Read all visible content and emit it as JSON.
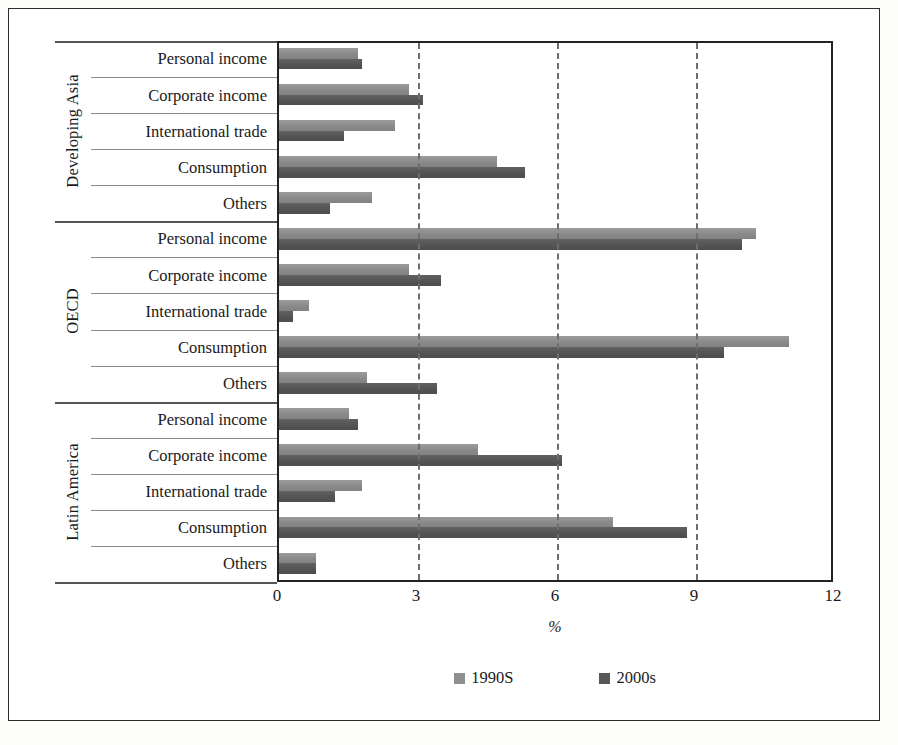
{
  "chart_data": {
    "type": "bar",
    "orientation": "horizontal",
    "title": "",
    "xlabel": "%",
    "ylabel": "",
    "xlim": [
      0,
      12
    ],
    "xticks": [
      "0",
      "3",
      "6",
      "9",
      "12"
    ],
    "grid": "vertical dashed at 3, 6, 9",
    "legend_position": "bottom",
    "series": [
      {
        "name": "1990S",
        "color": "#8f8f8f"
      },
      {
        "name": "2000s",
        "color": "#585858"
      }
    ],
    "groups": [
      {
        "name": "Developing Asia",
        "categories": [
          "Personal income",
          "Corporate income",
          "International trade",
          "Consumption",
          "Others"
        ],
        "values_1990s": [
          1.7,
          2.8,
          2.5,
          4.7,
          2.0
        ],
        "values_2000s": [
          1.8,
          3.1,
          1.4,
          5.3,
          1.1
        ]
      },
      {
        "name": "OECD",
        "categories": [
          "Personal income",
          "Corporate income",
          "International trade",
          "Consumption",
          "Others"
        ],
        "values_1990s": [
          10.3,
          2.8,
          0.65,
          11.0,
          1.9
        ],
        "values_2000s": [
          10.0,
          3.5,
          0.3,
          9.6,
          3.4
        ]
      },
      {
        "name": "Latin America",
        "categories": [
          "Personal income",
          "Corporate income",
          "International trade",
          "Consumption",
          "Others"
        ],
        "values_1990s": [
          1.5,
          4.3,
          1.8,
          7.2,
          0.8
        ],
        "values_2000s": [
          1.7,
          6.1,
          1.2,
          8.8,
          0.8
        ]
      }
    ]
  }
}
